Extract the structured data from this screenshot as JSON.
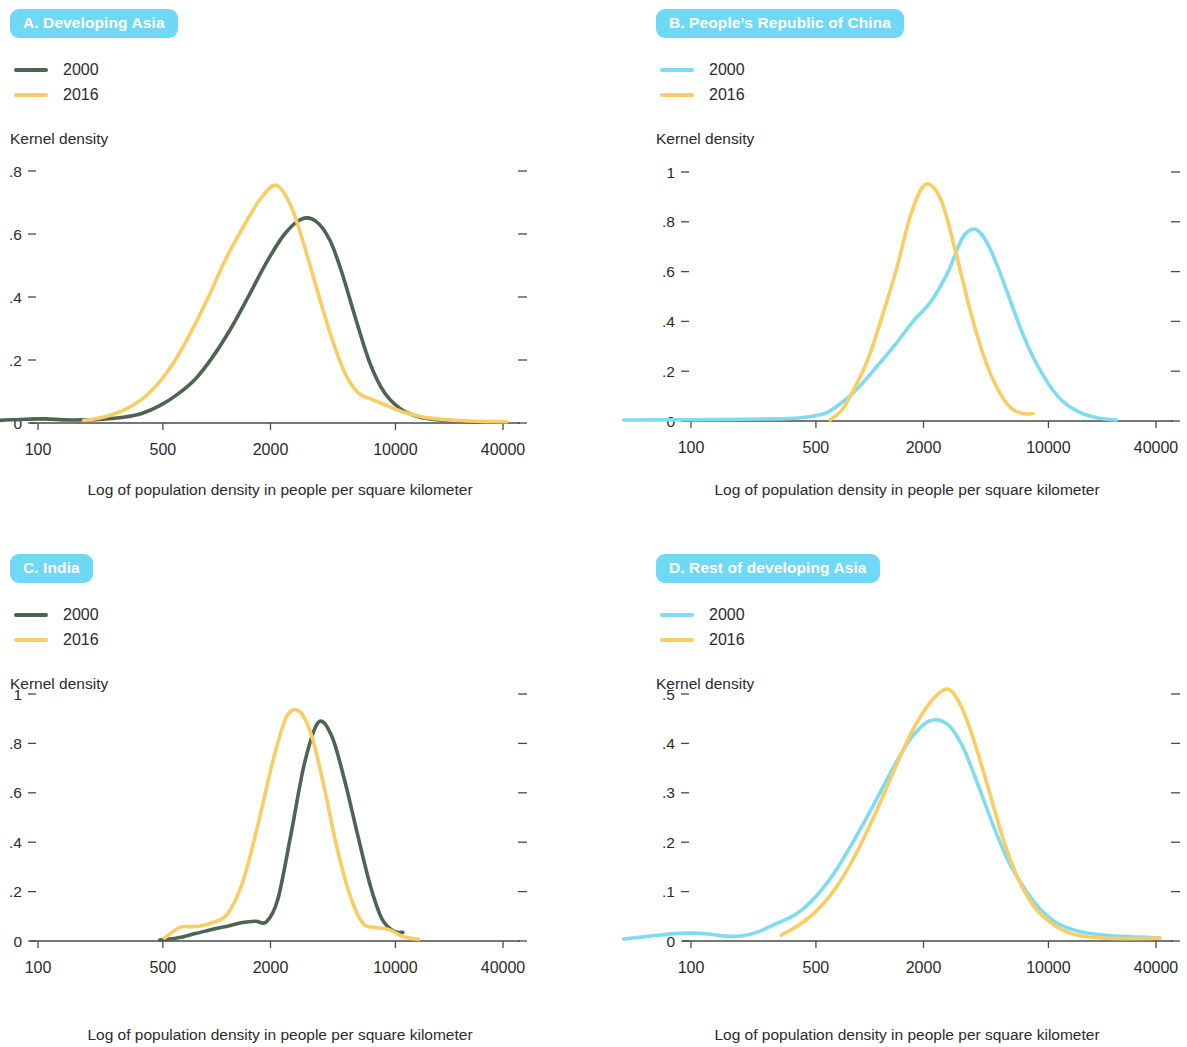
{
  "figure": {
    "axis_label_x": "Log of population density in people per square kilometer",
    "axis_label_y": "Kernel density",
    "badge_color": "#6fd8f5",
    "color_green": "#4e6452",
    "color_yellow": "#f9cd63",
    "color_cyan": "#7fdcf0",
    "axis_color": "#4a4a4a"
  },
  "panels": [
    {
      "id": "A",
      "badge": "A.  Developing Asia",
      "letter": "A.",
      "name": "Developing Asia",
      "legend": [
        {
          "label": "2000",
          "color": "#4e6452"
        },
        {
          "label": "2016",
          "color": "#f9cd63"
        }
      ],
      "ylabel": "Kernel density",
      "xlabel": "Log of population density in people per square kilometer",
      "yticks": [
        "0",
        ".2",
        ".4",
        ".6",
        ".8"
      ],
      "xticks": [
        "100",
        "500",
        "2000",
        "10000",
        "40000"
      ]
    },
    {
      "id": "B",
      "badge": "B.  People’s Republic of China",
      "letter": "B.",
      "name": "People’s Republic of China",
      "legend": [
        {
          "label": "2000",
          "color": "#7fdcf0"
        },
        {
          "label": "2016",
          "color": "#f9cd63"
        }
      ],
      "ylabel": "Kernel density",
      "xlabel": "Log of population density in people per square kilometer",
      "yticks": [
        "0",
        ".2",
        ".4",
        ".6",
        ".8",
        "1"
      ],
      "xticks": [
        "100",
        "500",
        "2000",
        "10000",
        "40000"
      ]
    },
    {
      "id": "C",
      "badge": "C.  India",
      "letter": "C.",
      "name": "India",
      "legend": [
        {
          "label": "2000",
          "color": "#4e6452"
        },
        {
          "label": "2016",
          "color": "#f9cd63"
        }
      ],
      "ylabel": "Kernel density",
      "xlabel": "Log of population density in people per square kilometer",
      "yticks": [
        "0",
        ".2",
        ".4",
        ".6",
        ".8",
        "1"
      ],
      "xticks": [
        "100",
        "500",
        "2000",
        "10000",
        "40000"
      ]
    },
    {
      "id": "D",
      "badge": "D.  Rest of developing Asia",
      "letter": "D.",
      "name": "Rest of developing Asia",
      "legend": [
        {
          "label": "2000",
          "color": "#7fdcf0"
        },
        {
          "label": "2016",
          "color": "#f9cd63"
        }
      ],
      "ylabel": "Kernel density",
      "xlabel": "Log of population density in people per square kilometer",
      "yticks": [
        "0",
        ".1",
        ".2",
        ".3",
        ".4",
        ".5"
      ],
      "xticks": [
        "100",
        "500",
        "2000",
        "10000",
        "40000"
      ]
    }
  ],
  "chart_data": [
    {
      "type": "line",
      "panel": "A",
      "title": "A.  Developing Asia",
      "xlabel": "Log of population density in people per square kilometer",
      "ylabel": "Kernel density",
      "xscale": "log",
      "xticks": [
        100,
        500,
        2000,
        10000,
        40000
      ],
      "yticks": [
        0,
        0.2,
        0.4,
        0.6,
        0.8
      ],
      "ylim": [
        0,
        0.8
      ],
      "xlim": [
        40,
        60000
      ],
      "grid": false,
      "legend_position": "top-left",
      "series": [
        {
          "name": "2000",
          "color": "#4e6452",
          "x": [
            42,
            60,
            85,
            110,
            140,
            180,
            230,
            300,
            380,
            480,
            600,
            760,
            950,
            1200,
            1500,
            1900,
            2400,
            3000,
            3600,
            4300,
            5000,
            6000,
            7200,
            8600,
            10500,
            13000,
            16000,
            20000,
            25000,
            31000
          ],
          "y": [
            0.006,
            0.008,
            0.012,
            0.013,
            0.01,
            0.01,
            0.012,
            0.018,
            0.03,
            0.055,
            0.09,
            0.14,
            0.21,
            0.3,
            0.4,
            0.51,
            0.6,
            0.648,
            0.64,
            0.58,
            0.48,
            0.33,
            0.19,
            0.1,
            0.048,
            0.022,
            0.012,
            0.008,
            0.005,
            0.003
          ]
        },
        {
          "name": "2016",
          "color": "#f9cd63",
          "x": [
            180,
            230,
            300,
            380,
            470,
            580,
            720,
            900,
            1100,
            1400,
            1750,
            2150,
            2600,
            3100,
            3700,
            4400,
            5200,
            6200,
            7400,
            9000,
            11000,
            14000,
            18000,
            24000,
            32000,
            42000
          ],
          "y": [
            0.008,
            0.018,
            0.04,
            0.075,
            0.125,
            0.195,
            0.29,
            0.4,
            0.51,
            0.62,
            0.71,
            0.755,
            0.69,
            0.56,
            0.41,
            0.27,
            0.16,
            0.095,
            0.075,
            0.055,
            0.035,
            0.02,
            0.012,
            0.007,
            0.005,
            0.004
          ]
        }
      ]
    },
    {
      "type": "line",
      "panel": "B",
      "title": "B.  People’s Republic of China",
      "xlabel": "Log of population density in people per square kilometer",
      "ylabel": "Kernel density",
      "xscale": "log",
      "xticks": [
        100,
        500,
        2000,
        10000,
        40000
      ],
      "yticks": [
        0,
        0.2,
        0.4,
        0.6,
        0.8,
        1.0
      ],
      "ylim": [
        0,
        1.0
      ],
      "xlim": [
        40,
        60000
      ],
      "grid": false,
      "legend_position": "top-left",
      "series": [
        {
          "name": "2000",
          "color": "#7fdcf0",
          "x": [
            42,
            80,
            150,
            260,
            400,
            560,
            700,
            880,
            1100,
            1400,
            1750,
            2200,
            2750,
            3300,
            3900,
            4500,
            5200,
            6000,
            7000,
            8300,
            10000,
            12000,
            15000,
            19000,
            24000
          ],
          "y": [
            0.004,
            0.005,
            0.006,
            0.008,
            0.012,
            0.03,
            0.075,
            0.14,
            0.22,
            0.31,
            0.4,
            0.48,
            0.6,
            0.735,
            0.77,
            0.72,
            0.62,
            0.5,
            0.37,
            0.25,
            0.15,
            0.08,
            0.035,
            0.012,
            0.004
          ]
        },
        {
          "name": "2016",
          "color": "#f9cd63",
          "x": [
            600,
            700,
            820,
            980,
            1150,
            1400,
            1700,
            2050,
            2500,
            3000,
            3600,
            4300,
            5100,
            6100,
            7200,
            8200
          ],
          "y": [
            0.005,
            0.045,
            0.13,
            0.25,
            0.4,
            0.6,
            0.83,
            0.95,
            0.89,
            0.69,
            0.46,
            0.27,
            0.14,
            0.055,
            0.03,
            0.03
          ]
        }
      ]
    },
    {
      "type": "line",
      "panel": "C",
      "title": "C.  India",
      "xlabel": "Log of population density in people per square kilometer",
      "ylabel": "Kernel density",
      "xscale": "log",
      "xticks": [
        100,
        500,
        2000,
        10000,
        40000
      ],
      "yticks": [
        0,
        0.2,
        0.4,
        0.6,
        0.8,
        1.0
      ],
      "ylim": [
        0,
        1.0
      ],
      "xlim": [
        40,
        60000
      ],
      "grid": false,
      "legend_position": "top-left",
      "series": [
        {
          "name": "2000",
          "color": "#4e6452",
          "x": [
            480,
            600,
            760,
            950,
            1150,
            1400,
            1650,
            1900,
            2200,
            2600,
            3100,
            3700,
            4400,
            5200,
            6100,
            7200,
            8400,
            9800,
            11000
          ],
          "y": [
            0.004,
            0.012,
            0.03,
            0.048,
            0.06,
            0.075,
            0.08,
            0.078,
            0.17,
            0.43,
            0.72,
            0.885,
            0.83,
            0.65,
            0.44,
            0.23,
            0.09,
            0.04,
            0.035
          ]
        },
        {
          "name": "2016",
          "color": "#f9cd63",
          "x": [
            510,
            620,
            700,
            800,
            950,
            1150,
            1400,
            1700,
            2050,
            2450,
            2900,
            3400,
            4000,
            4700,
            5600,
            6600,
            7800,
            9300,
            11000,
            13500
          ],
          "y": [
            0.012,
            0.055,
            0.058,
            0.06,
            0.075,
            0.11,
            0.24,
            0.47,
            0.72,
            0.905,
            0.93,
            0.83,
            0.62,
            0.38,
            0.18,
            0.07,
            0.055,
            0.045,
            0.018,
            0.006
          ]
        }
      ]
    },
    {
      "type": "line",
      "panel": "D",
      "title": "D.  Rest of developing Asia",
      "xlabel": "Log of population density in people per square kilometer",
      "ylabel": "Kernel density",
      "xscale": "log",
      "xticks": [
        100,
        500,
        2000,
        10000,
        40000
      ],
      "yticks": [
        0,
        0.1,
        0.2,
        0.3,
        0.4,
        0.5
      ],
      "ylim": [
        0,
        0.5
      ],
      "xlim": [
        40,
        60000
      ],
      "grid": false,
      "legend_position": "top-left",
      "series": [
        {
          "name": "2000",
          "color": "#7fdcf0",
          "x": [
            42,
            60,
            80,
            100,
            125,
            155,
            190,
            235,
            300,
            390,
            500,
            640,
            820,
            1050,
            1350,
            1700,
            2150,
            2700,
            3300,
            4000,
            4900,
            6000,
            7400,
            9000,
            11000,
            14000,
            18000,
            24000,
            32000,
            42000
          ],
          "y": [
            0.004,
            0.01,
            0.015,
            0.016,
            0.014,
            0.01,
            0.01,
            0.018,
            0.035,
            0.055,
            0.09,
            0.14,
            0.205,
            0.275,
            0.35,
            0.41,
            0.445,
            0.44,
            0.395,
            0.32,
            0.235,
            0.16,
            0.105,
            0.065,
            0.038,
            0.022,
            0.014,
            0.01,
            0.008,
            0.006
          ]
        },
        {
          "name": "2016",
          "color": "#f9cd63",
          "x": [
            320,
            400,
            500,
            640,
            820,
            1050,
            1350,
            1700,
            2150,
            2700,
            3200,
            3800,
            4600,
            5600,
            6800,
            8300,
            10500,
            13500,
            18000,
            24000,
            32000,
            42000
          ],
          "y": [
            0.012,
            0.032,
            0.06,
            0.105,
            0.17,
            0.25,
            0.34,
            0.42,
            0.48,
            0.51,
            0.48,
            0.41,
            0.31,
            0.205,
            0.125,
            0.07,
            0.035,
            0.015,
            0.007,
            0.005,
            0.005,
            0.006
          ]
        }
      ]
    }
  ]
}
